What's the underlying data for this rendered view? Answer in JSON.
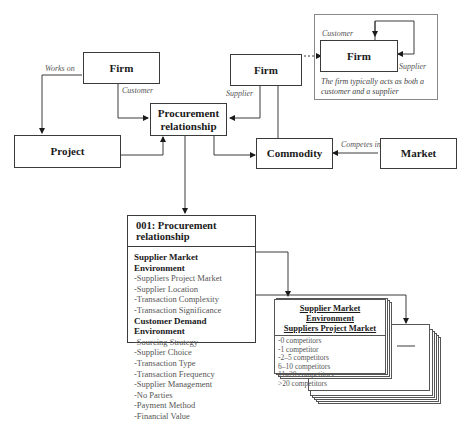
{
  "diagram": {
    "nodes": {
      "firm_left": "Firm",
      "firm_center": "Firm",
      "firm_inset": "Firm",
      "procurement": "Procurement relationship",
      "project": "Project",
      "commodity": "Commodity",
      "market": "Market"
    },
    "edge_labels": {
      "works_on": "Works on",
      "customer": "Customer",
      "supplier": "Supplier",
      "competes_in": "Competes in",
      "inset_customer": "Customer",
      "inset_supplier": "Supplier"
    },
    "inset_note": "The firm typically acts as both a customer and a supplier",
    "entity": {
      "title": "001: Procurement relationship",
      "sections": [
        {
          "heading": "Supplier Market Environment",
          "items": [
            "-Suppliers Project Market",
            "-Supplier Location",
            "-Transaction Complexity",
            "-Transaction Significance"
          ]
        },
        {
          "heading": "Customer Demand Environment",
          "items": [
            "-Sourcing Strategy",
            "-Supplier Choice",
            "-Transaction Type",
            "-Transaction Frequency",
            "-Supplier Management",
            "-No Parties",
            "-Payment Method",
            "-Financial Value"
          ]
        }
      ]
    },
    "card": {
      "title_line1": "Supplier Market Environment",
      "title_line2": "Suppliers Project Market",
      "items": [
        "-0 competitors",
        "-1 competitor",
        "-2–5 competitors",
        "6–10 competitors",
        "11–20 competitors",
        ">20 competitors"
      ]
    },
    "colors": {
      "line": "#3a3a3a",
      "inset_border": "#888888",
      "label": "#555555"
    }
  }
}
